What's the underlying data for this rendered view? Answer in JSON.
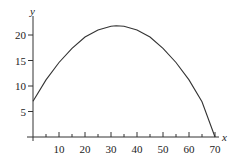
{
  "chart_data": {
    "type": "line",
    "title": "",
    "xlabel": "x",
    "ylabel": "y",
    "xlim": [
      0,
      70
    ],
    "ylim": [
      0,
      22
    ],
    "x_ticks_major": [
      10,
      20,
      30,
      40,
      50,
      60,
      70
    ],
    "x_ticks_minor": [
      5,
      15,
      25,
      35,
      45,
      55,
      65
    ],
    "y_ticks": [
      5,
      10,
      15,
      20
    ],
    "grid": false,
    "legend": null,
    "series": [
      {
        "name": "curve",
        "description": "Downward-opening parabola starting at y≈7 when x=0, peaking near (32, 22), returning to 0 at x=70",
        "x": [
          0,
          5,
          10,
          15,
          20,
          25,
          30,
          32,
          35,
          40,
          45,
          50,
          55,
          60,
          65,
          70
        ],
        "values": [
          7.0,
          11.2,
          14.6,
          17.4,
          19.6,
          21.0,
          21.7,
          21.8,
          21.7,
          21.0,
          19.6,
          17.4,
          14.6,
          11.2,
          6.9,
          0.0
        ]
      }
    ]
  }
}
